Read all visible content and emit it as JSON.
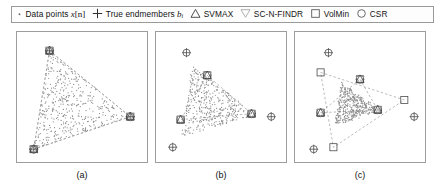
{
  "figure": {
    "background": "#ffffff",
    "panel_count": 3
  },
  "legend": {
    "items": [
      {
        "icon": "dot-marker",
        "label": "Data points",
        "math": "x",
        "math_suffix": "[n]",
        "subscript": ""
      },
      {
        "icon": "plus-circle-marker",
        "label": "True endmembers",
        "math": "b",
        "math_suffix": "",
        "subscript": "i"
      },
      {
        "icon": "triangle-up-marker",
        "label": "SVMAX",
        "math": "",
        "math_suffix": "",
        "subscript": ""
      },
      {
        "icon": "triangle-down-marker",
        "label": "SC-N-FINDR",
        "math": "",
        "math_suffix": "",
        "subscript": ""
      },
      {
        "icon": "square-marker",
        "label": "VolMin",
        "math": "",
        "math_suffix": "",
        "subscript": ""
      },
      {
        "icon": "circle-marker",
        "label": "CSR",
        "math": "",
        "math_suffix": "",
        "subscript": ""
      }
    ]
  },
  "colors": {
    "frame": "#9d9d9d",
    "data_point": "#8a8a8a",
    "marker_stroke": "#4a4a4a",
    "dashed_line": "#9a9a9a",
    "text": "#141414"
  },
  "captions": {
    "a": "(a)",
    "b": "(b)",
    "c": "(c)"
  },
  "chart_data": {
    "type": "scatter",
    "xlabel": "",
    "ylabel": "",
    "xlim": [
      0,
      132
    ],
    "ylim": [
      0,
      132
    ],
    "grid": false,
    "legend_position": "top",
    "panels": [
      {
        "id": "a",
        "caption": "(a)",
        "description": "High purity: data fills the true simplex; all estimates coincide with true endmembers at the vertices.",
        "true_endmembers": [
          [
            33,
            19
          ],
          [
            115,
            86
          ],
          [
            17,
            119
          ]
        ],
        "estimates": {
          "SVMAX": [
            [
              33,
              19
            ],
            [
              115,
              86
            ],
            [
              17,
              119
            ]
          ],
          "SC-N-FINDR": [
            [
              33,
              19
            ],
            [
              115,
              86
            ],
            [
              17,
              119
            ]
          ],
          "VolMin": [
            [
              33,
              19
            ],
            [
              115,
              86
            ],
            [
              17,
              119
            ]
          ],
          "CSR": [
            [
              33,
              19
            ],
            [
              115,
              86
            ],
            [
              17,
              119
            ]
          ]
        },
        "data_cloud": {
          "centroid": [
            55,
            75
          ],
          "spread": 1.0,
          "n_points": 430,
          "fill_fraction": 1.0
        }
      },
      {
        "id": "b",
        "caption": "(b)",
        "description": "Moderate purity: data cloud shrinks inward; estimated endmembers fall inside the true simplex.",
        "true_endmembers": [
          [
            31,
            21
          ],
          [
            117,
            86
          ],
          [
            17,
            117
          ]
        ],
        "estimates": {
          "SVMAX": [
            [
              52,
              44
            ],
            [
              97,
              83
            ],
            [
              25,
              89
            ]
          ],
          "SC-N-FINDR": [
            [
              52,
              44
            ],
            [
              97,
              83
            ],
            [
              25,
              89
            ]
          ],
          "VolMin": [
            [
              52,
              44
            ],
            [
              97,
              83
            ],
            [
              25,
              89
            ]
          ],
          "CSR": [
            [
              52,
              44
            ],
            [
              97,
              83
            ],
            [
              25,
              89
            ]
          ]
        },
        "data_cloud": {
          "centroid": [
            56,
            74
          ],
          "spread": 0.76,
          "n_points": 430,
          "fill_fraction": 0.76
        }
      },
      {
        "id": "c",
        "caption": "(c)",
        "description": "Low purity: data heavily clustered near the centroid; estimated simplex is far smaller than the true one.",
        "true_endmembers": [
          [
            34,
            21
          ],
          [
            121,
            86
          ],
          [
            19,
            119
          ]
        ],
        "estimates": {
          "SVMAX": [
            [
              66,
              48
            ],
            [
              84,
              79
            ],
            [
              26,
              82
            ]
          ],
          "SC-N-FINDR": [
            [
              66,
              48
            ],
            [
              84,
              79
            ],
            [
              26,
              82
            ]
          ],
          "VolMin": [
            [
              26,
              41
            ],
            [
              111,
              69
            ],
            [
              39,
              117
            ]
          ],
          "CSR": [
            [
              66,
              48
            ],
            [
              84,
              79
            ],
            [
              26,
              82
            ]
          ]
        },
        "data_cloud": {
          "centroid": [
            58,
            75
          ],
          "spread": 0.45,
          "n_points": 430,
          "fill_fraction": 0.45
        }
      }
    ]
  }
}
